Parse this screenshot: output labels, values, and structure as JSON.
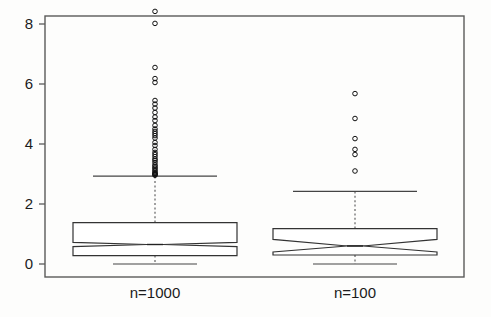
{
  "chart_data": {
    "type": "boxplot",
    "title": "",
    "xlabel": "",
    "ylabel": "",
    "ylim": [
      -0.35,
      8.7
    ],
    "yticks": [
      0,
      2,
      4,
      6,
      8
    ],
    "ytick_labels": [
      "0",
      "2",
      "4",
      "6",
      "8"
    ],
    "grid": false,
    "legend": null,
    "categories": [
      "n=1000",
      "n=100"
    ],
    "notched": true,
    "boxes": [
      {
        "label": "n=1000",
        "q1": 0.28,
        "median": 0.65,
        "q3": 1.38,
        "notch_lower": 0.58,
        "notch_upper": 0.72,
        "whisker_low": 0.0,
        "whisker_high": 2.93,
        "outliers": [
          8.42,
          8.02,
          6.55,
          6.18,
          6.05,
          5.45,
          5.33,
          5.2,
          5.05,
          4.9,
          4.78,
          4.62,
          4.5,
          4.42,
          4.35,
          4.28,
          4.2,
          4.05,
          3.95,
          3.82,
          3.72,
          3.65,
          3.58,
          3.5,
          3.45,
          3.38,
          3.3,
          3.25,
          3.2,
          3.15,
          3.1,
          3.05,
          3.02,
          3.0,
          2.98,
          2.96
        ]
      },
      {
        "label": "n=100",
        "q1": 0.3,
        "median": 0.6,
        "q3": 1.18,
        "notch_lower": 0.4,
        "notch_upper": 0.82,
        "whisker_low": 0.0,
        "whisker_high": 2.42,
        "outliers": [
          5.68,
          4.85,
          4.18,
          3.82,
          3.65,
          3.1
        ]
      }
    ],
    "colors": {
      "frame": "#5a5a5a",
      "box_stroke": "#333333",
      "box_fill": "#ffffff",
      "median": "#222222",
      "whisker": "#555555",
      "outlier": "#111111",
      "text": "#1b1b1b",
      "background": "#fdfdfc"
    }
  }
}
